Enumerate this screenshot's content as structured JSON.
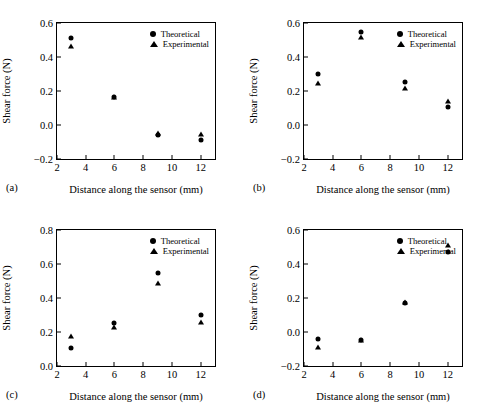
{
  "figure": {
    "legend": {
      "theoretical": "Theoretical",
      "experimental": "Experimental"
    },
    "axis": {
      "xlabel": "Distance along the sensor (mm)",
      "ylabel": "Shear force (N)"
    }
  },
  "chart_data": [
    {
      "type": "scatter",
      "panel": "(a)",
      "title": "",
      "xlabel": "Distance along the sensor (mm)",
      "ylabel": "Shear force (N)",
      "xlim": [
        2,
        13
      ],
      "ylim": [
        -0.2,
        0.6
      ],
      "xticks": [
        2,
        4,
        6,
        8,
        10,
        12
      ],
      "xtick_labels": [
        "2",
        "4",
        "6",
        "8",
        "10",
        "12"
      ],
      "yticks": [
        -0.2,
        0.0,
        0.2,
        0.4,
        0.6
      ],
      "ytick_labels": [
        "-0.2",
        "0.0",
        "0.2",
        "0.4",
        "0.6"
      ],
      "grid": false,
      "legend_position": "top-right",
      "x": [
        3,
        6,
        9,
        12
      ],
      "series": [
        {
          "name": "Theoretical",
          "marker": "circle",
          "values": [
            0.51,
            0.165,
            -0.06,
            -0.09
          ]
        },
        {
          "name": "Experimental",
          "marker": "triangle",
          "values": [
            0.465,
            0.165,
            -0.045,
            -0.055
          ]
        }
      ]
    },
    {
      "type": "scatter",
      "panel": "(b)",
      "title": "",
      "xlabel": "Distance along the sensor (mm)",
      "ylabel": "Shear force (N)",
      "xlim": [
        2,
        13
      ],
      "ylim": [
        -0.2,
        0.6
      ],
      "xticks": [
        2,
        4,
        6,
        8,
        10,
        12
      ],
      "xtick_labels": [
        "2",
        "4",
        "6",
        "8",
        "10",
        "12"
      ],
      "yticks": [
        -0.2,
        0.0,
        0.2,
        0.4,
        0.6
      ],
      "ytick_labels": [
        "-0.2",
        "0.0",
        "0.2",
        "0.4",
        "0.6"
      ],
      "grid": false,
      "legend_position": "top-right",
      "x": [
        3,
        6,
        9,
        12
      ],
      "series": [
        {
          "name": "Theoretical",
          "marker": "circle",
          "values": [
            0.3,
            0.545,
            0.255,
            0.105
          ]
        },
        {
          "name": "Experimental",
          "marker": "triangle",
          "values": [
            0.245,
            0.515,
            0.22,
            0.14
          ]
        }
      ]
    },
    {
      "type": "scatter",
      "panel": "(c)",
      "title": "",
      "xlabel": "Distance along the sensor (mm)",
      "ylabel": "Shear force (N)",
      "xlim": [
        2,
        13
      ],
      "ylim": [
        0.0,
        0.8
      ],
      "xticks": [
        2,
        4,
        6,
        8,
        10,
        12
      ],
      "xtick_labels": [
        "2",
        "4",
        "6",
        "8",
        "10",
        "12"
      ],
      "yticks": [
        0.0,
        0.2,
        0.4,
        0.6,
        0.8
      ],
      "ytick_labels": [
        "0.0",
        "0.2",
        "0.4",
        "0.6",
        "0.8"
      ],
      "grid": false,
      "legend_position": "top-right",
      "x": [
        3,
        6,
        9,
        12
      ],
      "series": [
        {
          "name": "Theoretical",
          "marker": "circle",
          "values": [
            0.105,
            0.255,
            0.55,
            0.3
          ]
        },
        {
          "name": "Experimental",
          "marker": "triangle",
          "values": [
            0.175,
            0.23,
            0.49,
            0.26
          ]
        }
      ]
    },
    {
      "type": "scatter",
      "panel": "(d)",
      "title": "",
      "xlabel": "Distance along the sensor (mm)",
      "ylabel": "Shear force (N)",
      "xlim": [
        2,
        13
      ],
      "ylim": [
        -0.2,
        0.6
      ],
      "xticks": [
        2,
        4,
        6,
        8,
        10,
        12
      ],
      "xtick_labels": [
        "2",
        "4",
        "6",
        "8",
        "10",
        "12"
      ],
      "yticks": [
        -0.2,
        0.0,
        0.2,
        0.4,
        0.6
      ],
      "ytick_labels": [
        "-0.2",
        "0.0",
        "0.2",
        "0.4",
        "0.6"
      ],
      "grid": false,
      "legend_position": "top-right",
      "x": [
        3,
        6,
        9,
        12
      ],
      "series": [
        {
          "name": "Theoretical",
          "marker": "circle",
          "values": [
            -0.04,
            -0.045,
            0.17,
            0.47
          ]
        },
        {
          "name": "Experimental",
          "marker": "triangle",
          "values": [
            -0.09,
            -0.045,
            0.175,
            0.51
          ]
        }
      ]
    }
  ]
}
